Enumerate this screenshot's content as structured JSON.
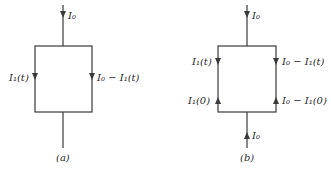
{
  "diagrams": {
    "a": {
      "caption": "(a)",
      "labels": {
        "top_input": "I₀",
        "left_branch": "I₁(t)",
        "right_branch": "I₀ − I₁(t)"
      }
    },
    "b": {
      "caption": "(b)",
      "labels": {
        "top_output": "I₀",
        "left_branch_top": "I₁(t)",
        "right_branch_top": "I₀ − I₁(t)",
        "left_branch_bottom": "I₁(0)",
        "right_branch_bottom": "I₀ − I₁(0)",
        "bottom_input": "I₀"
      }
    }
  },
  "colors": {
    "line": "#3a3a3a",
    "text": "#2a2a2a",
    "background": "#ffffff"
  }
}
